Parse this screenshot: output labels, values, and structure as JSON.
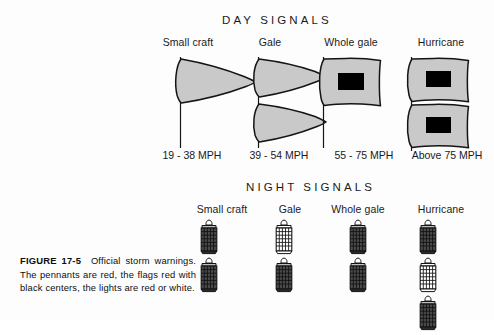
{
  "figure": {
    "caption_number": "FIGURE 17-5",
    "caption_text": "Official storm warnings. The pennants are red, the flags red with black centers, the lights are red or white."
  },
  "day": {
    "title": "DAY SIGNALS",
    "columns": [
      {
        "label": "Small craft",
        "speed": "19 - 38 MPH",
        "shape": "pennant",
        "count": 1
      },
      {
        "label": "Gale",
        "speed": "39 - 54 MPH",
        "shape": "pennant",
        "count": 2
      },
      {
        "label": "Whole gale",
        "speed": "55 - 75 MPH",
        "shape": "flag",
        "count": 1
      },
      {
        "label": "Hurricane",
        "speed": "Above 75 MPH",
        "shape": "flag",
        "count": 2
      }
    ]
  },
  "night": {
    "title": "NIGHT SIGNALS",
    "columns": [
      {
        "label": "Small craft",
        "lanterns": [
          "dark",
          "dark"
        ]
      },
      {
        "label": "Gale",
        "lanterns": [
          "light",
          "dark"
        ]
      },
      {
        "label": "Whole gale",
        "lanterns": [
          "dark",
          "dark"
        ]
      },
      {
        "label": "Hurricane",
        "lanterns": [
          "dark",
          "light",
          "dark"
        ]
      }
    ]
  },
  "colors": {
    "flag_fill": "#c9c9c9",
    "flag_outline": "#141414",
    "flag_center": "#000000",
    "lantern_dark": "#4a4a4a",
    "lantern_light": "#ffffff",
    "ink": "#111111",
    "background": "#ffffff"
  }
}
